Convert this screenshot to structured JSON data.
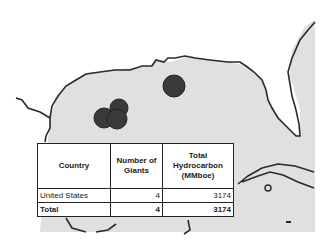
{
  "map": {
    "region": "Gulf of Mexico",
    "sea_color": "#e0e0e0",
    "land_color": "#ffffff",
    "coast_color": "#2a2a2a",
    "marker_color": "#3a3a3a",
    "markers": [
      {
        "label": "giant field",
        "cx": 174,
        "cy": 86,
        "r": 11
      },
      {
        "label": "giant field",
        "cx": 104,
        "cy": 118,
        "r": 10
      },
      {
        "label": "giant field",
        "cx": 119,
        "cy": 108,
        "r": 9
      },
      {
        "label": "giant field",
        "cx": 117,
        "cy": 119,
        "r": 10
      }
    ]
  },
  "table": {
    "headers": [
      "Country",
      "Number of Giants",
      "Total Hydrocarbon (MMboe)"
    ],
    "rows": [
      {
        "country": "United States",
        "giants": "4",
        "hydrocarbon": "3174"
      }
    ],
    "total": {
      "label": "Total",
      "giants": "4",
      "hydrocarbon": "3174"
    }
  }
}
